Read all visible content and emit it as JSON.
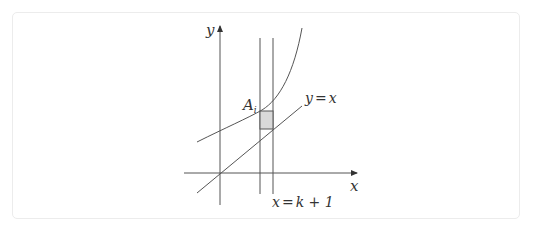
{
  "diagram": {
    "axes": {
      "x_label": "x",
      "y_label": "y"
    },
    "labels": {
      "point": "A",
      "point_sub": "i",
      "line_eq_lhs": "y",
      "line_eq_eq": "=",
      "line_eq_rhs": "x",
      "vline_lhs": "x",
      "vline_eq": "=",
      "vline_rhs": "k + 1"
    },
    "elements": [
      "x-axis with arrow",
      "y-axis with arrow",
      "increasing convex curve",
      "line y = x",
      "vertical line x = k",
      "vertical line x = k + 1",
      "shaded rectangle between curve and line y = x"
    ],
    "colors": {
      "stroke": "#555555",
      "shade": "#d9d9d9",
      "border": "#ececec"
    }
  }
}
